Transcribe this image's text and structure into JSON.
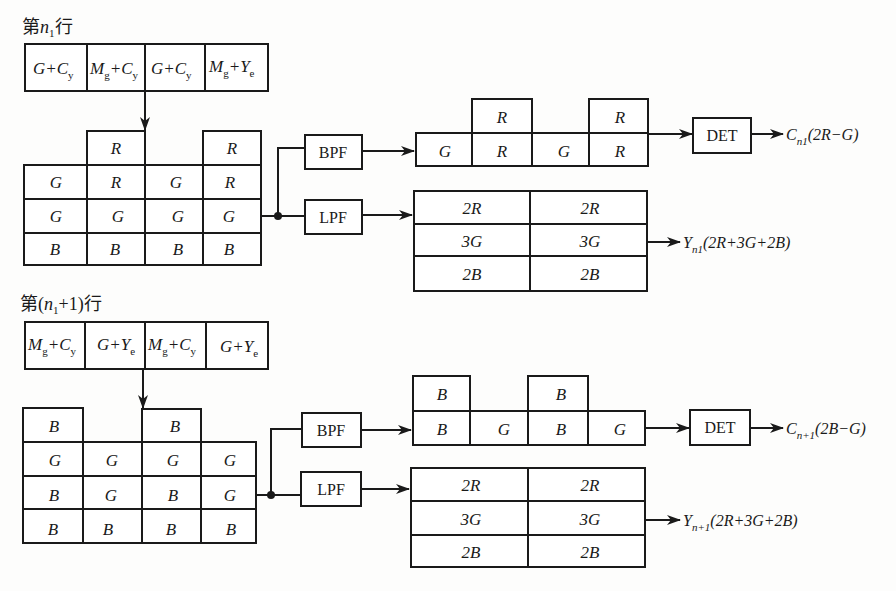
{
  "diagram": {
    "row1": {
      "title": {
        "prefix": "第",
        "var": "n",
        "sub": "1",
        "suffix": "行"
      },
      "header_cells": [
        {
          "main": "G+C",
          "sub": "y"
        },
        {
          "main": "M",
          "sub1": "g",
          "mid": "+C",
          "sub": "y"
        },
        {
          "main": "G+C",
          "sub": "y"
        },
        {
          "main": "M",
          "sub1": "g",
          "mid": "+Y",
          "sub": "e"
        }
      ],
      "pixel_grid": {
        "top_row": [
          "",
          "R",
          "",
          "R"
        ],
        "rows": [
          [
            "G",
            "R",
            "G",
            "R"
          ],
          [
            "G",
            "G",
            "G",
            "G"
          ],
          [
            "B",
            "B",
            "B",
            "B"
          ]
        ]
      },
      "bpf_label": "BPF",
      "lpf_label": "LPF",
      "bpf_output": {
        "top": [
          "",
          "R",
          "",
          "R"
        ],
        "bottom": [
          "G",
          "R",
          "G",
          "R"
        ]
      },
      "lpf_output": [
        [
          "2R",
          "2R"
        ],
        [
          "3G",
          "3G"
        ],
        [
          "2B",
          "2B"
        ]
      ],
      "det_label": "DET",
      "chroma_output": {
        "var": "C",
        "sub": "n1",
        "expr": "(2R−G)"
      },
      "luma_output": {
        "var": "Y",
        "sub": "n1",
        "expr": "(2R+3G+2B)"
      }
    },
    "row2": {
      "title": {
        "prefix": "第(",
        "var": "n",
        "sub": "1",
        "suffix": "+1)行"
      },
      "header_cells": [
        {
          "main": "M",
          "sub1": "g",
          "mid": "+C",
          "sub": "y"
        },
        {
          "main": "G+Y",
          "sub": "e"
        },
        {
          "main": "M",
          "sub1": "g",
          "mid": "+C",
          "sub": "y"
        },
        {
          "main": "G+Y",
          "sub": "e"
        }
      ],
      "pixel_grid": {
        "top_row": [
          "B",
          "",
          "B",
          ""
        ],
        "rows": [
          [
            "G",
            "G",
            "G",
            "G"
          ],
          [
            "B",
            "G",
            "B",
            "G"
          ],
          [
            "B",
            "B",
            "B",
            "B"
          ]
        ]
      },
      "bpf_label": "BPF",
      "lpf_label": "LPF",
      "bpf_output": {
        "top": [
          "B",
          "",
          "B",
          ""
        ],
        "bottom": [
          "B",
          "G",
          "B",
          "G"
        ]
      },
      "lpf_output": [
        [
          "2R",
          "2R"
        ],
        [
          "3G",
          "3G"
        ],
        [
          "2B",
          "2B"
        ]
      ],
      "det_label": "DET",
      "chroma_output": {
        "var": "C",
        "sub": "n+1",
        "expr": "(2B−G)"
      },
      "luma_output": {
        "var": "Y",
        "sub": "n+1",
        "expr": "(2R+3G+2B)"
      }
    }
  }
}
